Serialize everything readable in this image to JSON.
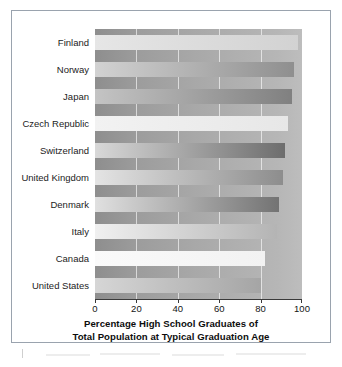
{
  "chart_data": {
    "type": "bar",
    "orientation": "horizontal",
    "title": "",
    "xlabel": "Percentage High School Graduates of Total Population at Typical Graduation Age",
    "xlabel_lines": [
      "Percentage High School Graduates of",
      "Total Population at Typical Graduation Age"
    ],
    "ylabel": "",
    "categories": [
      "Finland",
      "Norway",
      "Japan",
      "Czech Republic",
      "Switzerland",
      "United Kingdom",
      "Denmark",
      "Italy",
      "Canada",
      "United States"
    ],
    "values": [
      98,
      96,
      95,
      93,
      92,
      91,
      89,
      88,
      82,
      80
    ],
    "xlim": [
      0,
      100
    ],
    "xticks": [
      0,
      20,
      40,
      60,
      80,
      100
    ],
    "xtick_labels": [
      "0",
      "20",
      "40",
      "60",
      "80",
      "100"
    ],
    "grid": true,
    "legend": "none",
    "bar_gradients": [
      {
        "category": "Finland",
        "from": "#e6e6e6",
        "to": "#d2d2d2"
      },
      {
        "category": "Norway",
        "from": "#d2d2d2",
        "to": "#8f8f8f"
      },
      {
        "category": "Japan",
        "from": "#c4c4c4",
        "to": "#808080"
      },
      {
        "category": "Czech Republic",
        "from": "#f2f2f2",
        "to": "#e7e7e7"
      },
      {
        "category": "Switzerland",
        "from": "#d8d8d8",
        "to": "#6d6d6d"
      },
      {
        "category": "United Kingdom",
        "from": "#e4e4e4",
        "to": "#8d8d8d"
      },
      {
        "category": "Denmark",
        "from": "#e0e0e0",
        "to": "#737373"
      },
      {
        "category": "Italy",
        "from": "#f0f0f0",
        "to": "#b4b4b4"
      },
      {
        "category": "Canada",
        "from": "#fafafa",
        "to": "#f2f2f2"
      },
      {
        "category": "United States",
        "from": "#d6d6d6",
        "to": "#a5a5a5"
      }
    ],
    "plot_background_gradient": {
      "from": "#8e8e8e",
      "to": "#bdbdbd"
    },
    "gridline_color": "#ffffff",
    "axis_color": "#3a3a3a",
    "frame_color": "#9aa3ae"
  }
}
